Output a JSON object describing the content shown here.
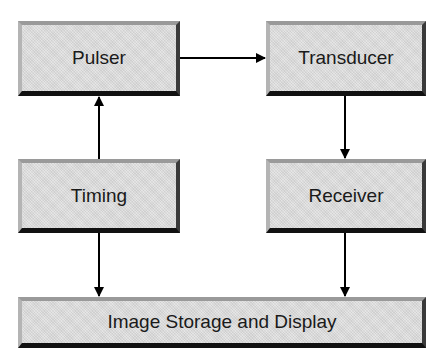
{
  "diagram": {
    "nodes": [
      {
        "id": "pulser",
        "label": "Pulser"
      },
      {
        "id": "transducer",
        "label": "Transducer"
      },
      {
        "id": "timing",
        "label": "Timing"
      },
      {
        "id": "receiver",
        "label": "Receiver"
      },
      {
        "id": "storage",
        "label": "Image Storage and Display"
      }
    ],
    "edges": [
      {
        "from": "pulser",
        "to": "transducer"
      },
      {
        "from": "timing",
        "to": "pulser"
      },
      {
        "from": "transducer",
        "to": "receiver"
      },
      {
        "from": "timing",
        "to": "storage"
      },
      {
        "from": "receiver",
        "to": "storage"
      }
    ],
    "colors": {
      "box_fill": "#dcdcdc",
      "box_shadow": "#111111",
      "arrow": "#000000",
      "text": "#1a1a1a"
    }
  }
}
